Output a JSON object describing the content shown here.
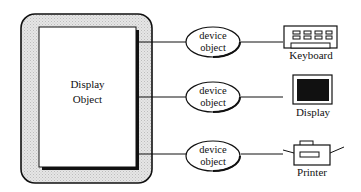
{
  "diagram": {
    "container": {
      "label_line1": "Display",
      "label_line2": "Object"
    },
    "device_objects": [
      {
        "line1": "device",
        "line2": "object"
      },
      {
        "line1": "device",
        "line2": "object"
      },
      {
        "line1": "device",
        "line2": "object"
      }
    ],
    "devices": [
      {
        "label": "Keyboard",
        "icon": "keyboard-icon"
      },
      {
        "label": "Display",
        "icon": "monitor-icon"
      },
      {
        "label": "Printer",
        "icon": "printer-icon"
      }
    ],
    "colors": {
      "stroke": "#111111",
      "container_fill": "#d9d9d9",
      "screen_fill": "#111111"
    }
  }
}
